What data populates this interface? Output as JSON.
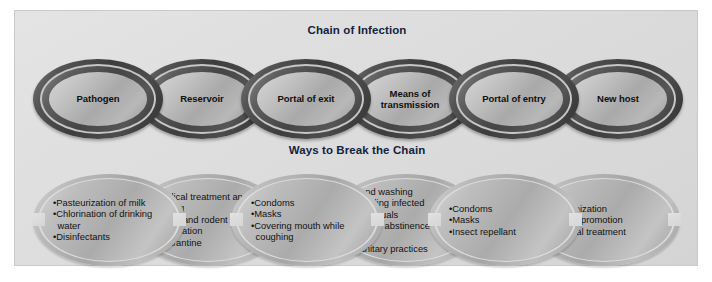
{
  "figure": {
    "background_color": "#dedede",
    "panel_border_color": "#c9c9c9"
  },
  "sections": {
    "top": {
      "title": "Chain of Infection",
      "title_color": "#13233f"
    },
    "bottom": {
      "title": "Ways to Break the Chain",
      "title_color": "#13233f"
    }
  },
  "chain_of_infection": {
    "links": [
      {
        "label": "Pathogen"
      },
      {
        "label": "Reservoir"
      },
      {
        "label": "Portal of exit"
      },
      {
        "label": "Means of\ntransmission"
      },
      {
        "label": "Portal of entry"
      },
      {
        "label": "New host"
      }
    ]
  },
  "ways_to_break_the_chain": {
    "links": [
      {
        "items": [
          "Pasteurization of milk",
          "Chlorination of drinking water",
          "Disinfectants"
        ]
      },
      {
        "items": [
          "Medical treatment and testing",
          "Insect and rodent eradication",
          "Quarantine"
        ]
      },
      {
        "items": [
          "Condoms",
          "Masks",
          "Covering mouth while coughing"
        ]
      },
      {
        "items": [
          "Hand washing",
          "Avoiding infected individuals",
          "Sexual abstinence or safer sex",
          "Sanitary practices"
        ]
      },
      {
        "items": [
          "Condoms",
          "Masks",
          "Insect repellant"
        ]
      },
      {
        "items": [
          "Immunization",
          "Health promotion",
          "Medical treatment"
        ]
      }
    ]
  }
}
